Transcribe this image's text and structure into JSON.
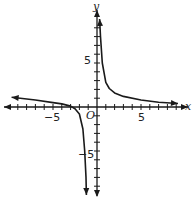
{
  "chart_data": {
    "type": "line",
    "title": "",
    "xlabel": "x",
    "ylabel": "y",
    "origin_label": "O",
    "xlim": [
      -10,
      10
    ],
    "ylim": [
      -10,
      10
    ],
    "grid": false,
    "tick_step": 1,
    "x_tick_labels": [
      {
        "value": -5,
        "text": "−5"
      },
      {
        "value": 5,
        "text": "5"
      }
    ],
    "y_tick_labels": [
      {
        "value": 5,
        "text": "5"
      },
      {
        "value": -5,
        "text": "−5"
      }
    ],
    "asymptotes": {
      "vertical": [
        -1,
        0.2
      ],
      "horizontal": [
        0
      ]
    },
    "series": [
      {
        "name": "left-branch",
        "points": [
          [
            -9.7,
            1.1
          ],
          [
            -7,
            0.8
          ],
          [
            -5,
            0.5
          ],
          [
            -4,
            0.35
          ],
          [
            -3,
            0.1
          ],
          [
            -2.5,
            -0.2
          ],
          [
            -2,
            -0.8
          ],
          [
            -1.6,
            -2.5
          ],
          [
            -1.4,
            -5
          ],
          [
            -1.25,
            -8
          ],
          [
            -1.2,
            -10
          ]
        ]
      },
      {
        "name": "right-branch",
        "points": [
          [
            0.3,
            10
          ],
          [
            0.4,
            8
          ],
          [
            0.6,
            5
          ],
          [
            1,
            2.8
          ],
          [
            1.4,
            2.1
          ],
          [
            2,
            1.6
          ],
          [
            3,
            1.2
          ],
          [
            5,
            0.8
          ],
          [
            7,
            0.55
          ],
          [
            9.2,
            0.4
          ]
        ]
      }
    ]
  },
  "labels": {
    "x_axis": "x",
    "y_axis": "y",
    "origin": "O",
    "x_pos5": "5",
    "x_neg5": "−5",
    "y_pos5": "5",
    "y_neg5": "−5"
  },
  "colors": {
    "axis": "#1a1a1a",
    "curve": "#1a1a1a"
  }
}
